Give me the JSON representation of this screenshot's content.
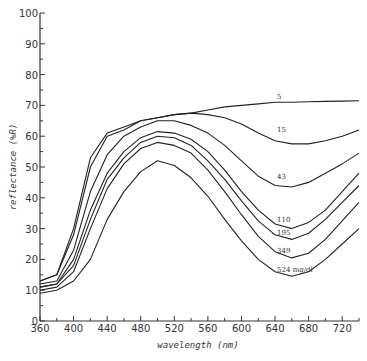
{
  "chart_data": {
    "type": "line",
    "title": "",
    "xlabel": "wavelength (nm)",
    "ylabel": "reflectance (%R)",
    "xlim": [
      360,
      740
    ],
    "ylim": [
      0,
      100
    ],
    "grid": false,
    "legend_position": "inline labels at right",
    "x_ticks": [
      360,
      400,
      440,
      480,
      520,
      560,
      600,
      640,
      680,
      720
    ],
    "y_ticks": [
      0,
      10,
      20,
      30,
      40,
      50,
      60,
      70,
      80,
      90,
      100
    ],
    "x": [
      360,
      380,
      400,
      420,
      440,
      460,
      480,
      500,
      520,
      540,
      560,
      580,
      600,
      620,
      640,
      660,
      680,
      700,
      720,
      740
    ],
    "series": [
      {
        "name": "5",
        "label_x": 640,
        "label_y": 72,
        "values": [
          13,
          15,
          30,
          53,
          61,
          63,
          65,
          66,
          67,
          67.5,
          68.5,
          69.5,
          70,
          70.5,
          71,
          71,
          71.2,
          71.3,
          71.4,
          71.5
        ]
      },
      {
        "name": "15",
        "label_x": 640,
        "label_y": 61.5,
        "values": [
          13,
          15,
          28,
          50,
          60,
          62,
          65,
          66,
          67,
          67.5,
          67,
          66,
          64,
          61,
          58.5,
          57.5,
          57.5,
          58.5,
          60,
          62
        ]
      },
      {
        "name": "43",
        "label_x": 640,
        "label_y": 46,
        "values": [
          12,
          13,
          23,
          42,
          54,
          60,
          63,
          65,
          65,
          63.5,
          61,
          57,
          52,
          47,
          44,
          43.5,
          45,
          48,
          51,
          54.5
        ]
      },
      {
        "name": "110",
        "label_x": 640,
        "label_y": 32,
        "values": [
          11,
          12,
          20,
          36,
          48,
          55,
          59.5,
          61.5,
          61,
          59,
          55,
          49,
          42,
          36,
          31.5,
          30,
          32,
          36,
          42,
          48
        ]
      },
      {
        "name": "195",
        "label_x": 640,
        "label_y": 28,
        "values": [
          11,
          12,
          18,
          33,
          46,
          53,
          58,
          60,
          59.5,
          57,
          52,
          46,
          39,
          32.5,
          28,
          26.5,
          28.5,
          33,
          38.5,
          44
        ]
      },
      {
        "name": "349",
        "label_x": 640,
        "label_y": 22,
        "values": [
          10,
          11,
          16,
          30,
          43,
          51,
          56,
          58,
          57,
          54.5,
          49,
          42,
          34.5,
          27.5,
          22.5,
          20.5,
          22,
          26.5,
          32.5,
          38.5
        ]
      },
      {
        "name": "524 mg/dl",
        "label_x": 640,
        "label_y": 16,
        "values": [
          9,
          10,
          13,
          20,
          33,
          42,
          48.5,
          52,
          50.5,
          46.5,
          40.5,
          33,
          26,
          20,
          16,
          14.5,
          16,
          20,
          25,
          30
        ]
      }
    ]
  },
  "axes": {
    "x_title": "wavelength (nm)",
    "y_title": "reflectance (%R)"
  }
}
